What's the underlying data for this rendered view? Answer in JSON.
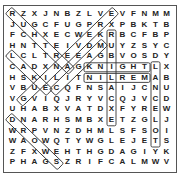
{
  "puzzle": {
    "rows": [
      "RZXJNBZLVEVFNMM",
      "JUGCFUGPRXPBKTB",
      "FCHXECWEKRBCFBP",
      "HNTTEIVDMUYZSYC",
      "LCLTREEAGBVOSDY",
      "CADXNAGKNIGHTLX",
      "HSKILITNILREMAB",
      "VBUECQFNSAIJCNU",
      "VGVIQJRYVCQJVCD",
      "UHABXVATDXFYREW",
      "DNARHSMBXETZGLJ",
      "WRPVNZDHMLSFSOI",
      "WAOWQTYWGLEJETS",
      "ZFXWEHTHGDAGIYK",
      "PHAGSZRIFCALMWV"
    ],
    "found_words": [
      {
        "word": "ARTHUR",
        "start": [
          6,
          6
        ],
        "end": [
          1,
          1
        ]
      },
      {
        "word": "GUINEVERE",
        "start": [
          9,
          2
        ],
        "end": [
          1,
          10
        ]
      },
      {
        "word": "MAGIC",
        "start": [
          4,
          9
        ],
        "end": [
          8,
          5
        ]
      },
      {
        "word": "LAKE",
        "start": [
          5,
          1
        ],
        "end": [
          8,
          4
        ]
      },
      {
        "word": "SWORD",
        "start": [
          15,
          5
        ],
        "end": [
          11,
          1
        ]
      },
      {
        "word": "KNIGHT",
        "start": [
          6,
          8
        ],
        "end": [
          6,
          13
        ]
      },
      {
        "word": "MERLIN",
        "start": [
          7,
          13
        ],
        "end": [
          7,
          8
        ]
      },
      {
        "word": "EXCALIBUR",
        "start": [
          11,
          10
        ],
        "end": [
          3,
          10
        ]
      },
      {
        "word": "LANCELOT",
        "start": [
          6,
          14
        ],
        "end": [
          13,
          14
        ]
      }
    ]
  }
}
